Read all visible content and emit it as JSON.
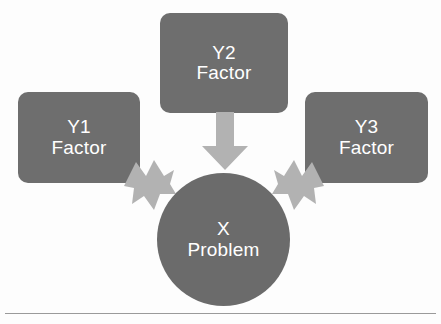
{
  "diagram": {
    "nodes": {
      "y1": {
        "title": "Y1",
        "subtitle": "Factor",
        "shape": "rounded-rectangle",
        "color": "#6e6e6e"
      },
      "y2": {
        "title": "Y2",
        "subtitle": "Factor",
        "shape": "rounded-rectangle",
        "color": "#6e6e6e"
      },
      "y3": {
        "title": "Y3",
        "subtitle": "Factor",
        "shape": "rounded-rectangle",
        "color": "#6e6e6e"
      },
      "x": {
        "title": "X",
        "subtitle": "Problem",
        "shape": "circle",
        "color": "#6b6b6b"
      }
    },
    "connectors": [
      {
        "name": "arrow-y1-to-x",
        "from": "y1",
        "to": "x",
        "direction": "down-right",
        "color": "#b2b2b2"
      },
      {
        "name": "arrow-y2-to-x",
        "from": "y2",
        "to": "x",
        "direction": "down",
        "color": "#b2b2b2"
      },
      {
        "name": "arrow-y3-to-x",
        "from": "y3",
        "to": "x",
        "direction": "down-left",
        "color": "#b2b2b2"
      }
    ],
    "rule": {
      "name": "baseline-rule",
      "color": "#9a9a9a"
    },
    "text_color": "#ffffff",
    "background": "#fdfdfd"
  }
}
